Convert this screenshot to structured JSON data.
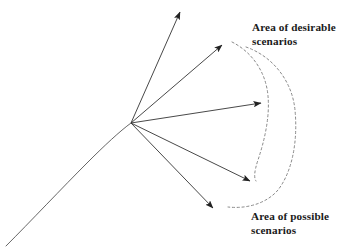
{
  "figure": {
    "background_color": "#ffffff",
    "width": 350,
    "height": 247
  },
  "labels": {
    "desirable": {
      "line1": "Area of desirable",
      "line2": "scenarios",
      "x": 252,
      "y": 21,
      "color": "#1a1a1a",
      "bold": true
    },
    "possible": {
      "line1": "Area of possible",
      "line2": "scenarios",
      "x": 251,
      "y": 210,
      "color": "#1a1a1a",
      "bold": true
    }
  },
  "chart_data": {
    "type": "diagram",
    "branch_point": {
      "x": 131,
      "y": 123
    },
    "trajectory": {
      "name": "historical-trajectory",
      "stroke": "#555555",
      "stroke_width": 0.9,
      "dashed": false,
      "path": "M 6 246 C 30 222 62 188 88 162 C 104 146 120 131 131 123"
    },
    "arrows": [
      {
        "name": "arrow-1",
        "from": {
          "x": 131,
          "y": 123
        },
        "to": {
          "x": 180,
          "y": 12
        },
        "label": ""
      },
      {
        "name": "arrow-2",
        "from": {
          "x": 131,
          "y": 123
        },
        "to": {
          "x": 222,
          "y": 45
        },
        "label": ""
      },
      {
        "name": "arrow-3",
        "from": {
          "x": 131,
          "y": 123
        },
        "to": {
          "x": 261,
          "y": 103
        },
        "label": ""
      },
      {
        "name": "arrow-4",
        "from": {
          "x": 131,
          "y": 123
        },
        "to": {
          "x": 250,
          "y": 181
        },
        "label": ""
      },
      {
        "name": "arrow-5",
        "from": {
          "x": 131,
          "y": 123
        },
        "to": {
          "x": 213,
          "y": 208
        },
        "label": ""
      }
    ],
    "arrow_style": {
      "stroke": "#333333",
      "stroke_width": 0.9,
      "head_length": 13,
      "head_width": 6
    },
    "envelopes": [
      {
        "name": "desirable-envelope",
        "dashed": true,
        "stroke": "#8a8a8a",
        "stroke_width": 1.0,
        "dash_array": "2.2 2.6",
        "path": "M 232 42 C 252 52 266 72 268 96 C 270 118 264 142 258 160 C 254 172 254 178 256 181"
      },
      {
        "name": "possible-envelope",
        "dashed": true,
        "stroke": "#8a8a8a",
        "stroke_width": 1.0,
        "dash_array": "2.2 2.6",
        "path": "M 246 47 C 272 56 292 80 295 110 C 298 142 292 172 278 190 C 266 204 246 209 228 207"
      }
    ],
    "axes": {
      "visible": false
    },
    "grid": false,
    "legend": {
      "visible": false
    }
  }
}
